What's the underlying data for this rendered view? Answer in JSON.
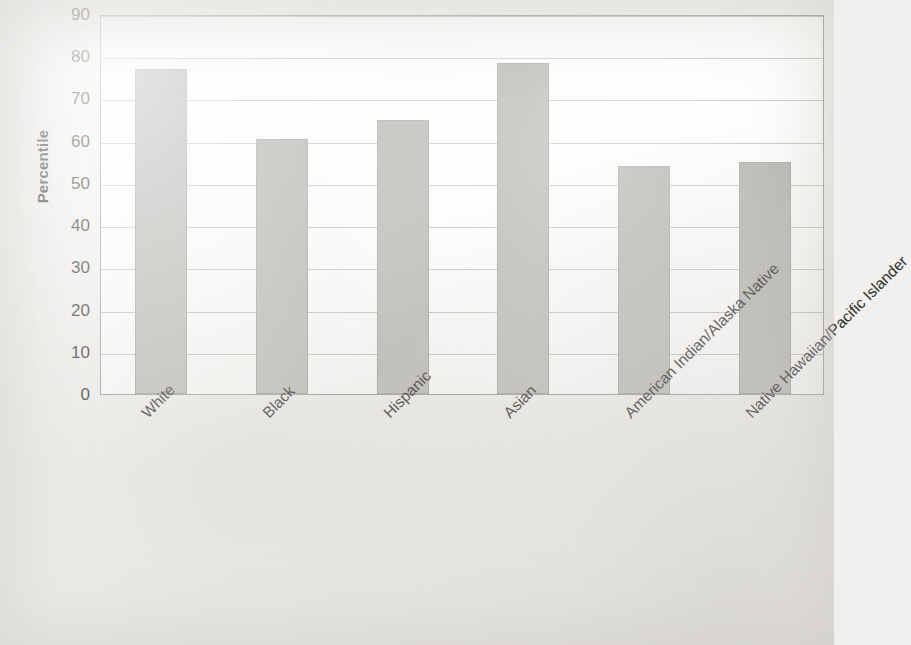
{
  "chart_data": {
    "type": "bar",
    "title": "",
    "subtitle": "",
    "xlabel": "",
    "ylabel": "Percentile",
    "ylim": [
      0,
      90
    ],
    "ytick_step": 10,
    "yticks": [
      90,
      80,
      70,
      60,
      50,
      40,
      30,
      20,
      10,
      0
    ],
    "grid": true,
    "legend": false,
    "legend_position": "none",
    "bar_color": "#b6b5b1",
    "bar_border_color": "#a2a19d",
    "plot_background": "#fdfdfc",
    "gridline_color": "#c2c1bc",
    "axis_color": "#9b9b97",
    "categories": [
      "White",
      "Black",
      "Hispanic",
      "Asian",
      "American Indian/Alaska Native",
      "Native Hawaiian/Pacific Islander"
    ],
    "values": [
      77,
      60.5,
      65,
      78.5,
      54,
      55
    ],
    "label_rotation": -45
  },
  "axis": {
    "y_title": "Percentile"
  }
}
